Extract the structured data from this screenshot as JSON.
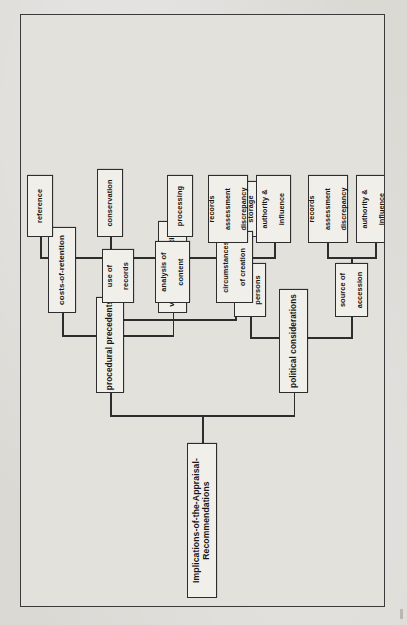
{
  "diagram": {
    "title": "Implications-of-the-Appraisal-Recommendations",
    "orientation": "rotated-90-ccw",
    "root": {
      "label": "Implications-of-the-Appraisal-Recommendations"
    },
    "branches": [
      {
        "label": "procedural precedents",
        "children": [
          {
            "label": "costs-of-retention",
            "children": [
              {
                "label": "reference"
              },
              {
                "label": "conservation"
              },
              {
                "label": "processing"
              },
              {
                "label": "storage"
              }
            ]
          },
          {
            "label": "value-of-information",
            "children": [
              {
                "label": "use of\nrecords"
              },
              {
                "label": "analysis of\ncontent"
              },
              {
                "label": "circumstances\nof creation"
              }
            ]
          }
        ]
      },
      {
        "label": "political considerations",
        "children": [
          {
            "label": "other\npersons",
            "children": [
              {
                "label": "records\nassessment\ndiscrepancy"
              },
              {
                "label": "authority &\ninfluence"
              }
            ]
          },
          {
            "label": "source of\naccession",
            "children": [
              {
                "label": "records\nassessment\ndiscrepancy"
              },
              {
                "label": "authority &\ninfluence"
              }
            ]
          }
        ]
      }
    ],
    "nodes": {
      "root": "Implications-of-the-Appraisal-Recommendations",
      "procedural_precedents": "procedural precedents",
      "political_considerations": "political considerations",
      "costs_of_retention": "costs-of-retention",
      "value_of_information": "value-of-information",
      "other_persons_l1": "other",
      "other_persons_l2": "persons",
      "source_of_accession_l1": "source of",
      "source_of_accession_l2": "accession",
      "reference": "reference",
      "conservation": "conservation",
      "processing": "processing",
      "storage": "storage",
      "use_of_records_l1": "use of",
      "use_of_records_l2": "records",
      "analysis_of_content_l1": "analysis of",
      "analysis_of_content_l2": "content",
      "circumstances_of_creation_l1": "circumstances",
      "circumstances_of_creation_l2": "of creation",
      "records_assessment_a_l1": "records",
      "records_assessment_a_l2": "assessment",
      "records_assessment_a_l3": "discrepancy",
      "authority_influence_a_l1": "authority &",
      "authority_influence_a_l2": "influence",
      "records_assessment_b_l1": "records",
      "records_assessment_b_l2": "assessment",
      "records_assessment_b_l3": "discrepancy",
      "authority_influence_b_l1": "authority &",
      "authority_influence_b_l2": "influence"
    },
    "colors": {
      "page_background": "#dbd9d4",
      "frame_background": "#e3e1dc",
      "node_background": "#f1efea",
      "ink": "#2d2d2d",
      "text": "#151515"
    }
  }
}
